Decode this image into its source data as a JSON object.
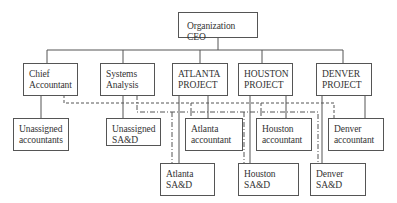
{
  "diagram": {
    "type": "organization-chart",
    "nodes": [
      {
        "id": "ceo",
        "label": "Organization CEO"
      },
      {
        "id": "chief_accountant",
        "label": "Chief\nAccountant"
      },
      {
        "id": "systems_analysis",
        "label": "Systems\nAnalysis"
      },
      {
        "id": "atlanta_project",
        "label": "ATLANTA\nPROJECT"
      },
      {
        "id": "houston_project",
        "label": "HOUSTON\nPROJECT"
      },
      {
        "id": "denver_project",
        "label": "DENVER\nPROJECT"
      },
      {
        "id": "unassigned_accountants",
        "label": "Unassigned\naccountants"
      },
      {
        "id": "unassigned_sad",
        "label": "Unassigned\nSA&D"
      },
      {
        "id": "atlanta_accountant",
        "label": "Atlanta\naccountant"
      },
      {
        "id": "houston_accountant",
        "label": "Houston\naccountant"
      },
      {
        "id": "denver_accountant",
        "label": "Denver\naccountant"
      },
      {
        "id": "atlanta_sad",
        "label": "Atlanta\nSA&D"
      },
      {
        "id": "houston_sad",
        "label": "Houston\nSA&D"
      },
      {
        "id": "denver_sad",
        "label": "Denver\nSA&D"
      }
    ],
    "edges": [
      {
        "from": "ceo",
        "to": "chief_accountant",
        "style": "solid"
      },
      {
        "from": "ceo",
        "to": "systems_analysis",
        "style": "solid"
      },
      {
        "from": "ceo",
        "to": "atlanta_project",
        "style": "solid"
      },
      {
        "from": "ceo",
        "to": "houston_project",
        "style": "solid"
      },
      {
        "from": "ceo",
        "to": "denver_project",
        "style": "solid"
      },
      {
        "from": "chief_accountant",
        "to": "unassigned_accountants",
        "style": "solid"
      },
      {
        "from": "systems_analysis",
        "to": "unassigned_sad",
        "style": "solid"
      },
      {
        "from": "atlanta_project",
        "to": "atlanta_accountant",
        "style": "solid"
      },
      {
        "from": "atlanta_project",
        "to": "atlanta_sad",
        "style": "solid"
      },
      {
        "from": "houston_project",
        "to": "houston_accountant",
        "style": "solid"
      },
      {
        "from": "houston_project",
        "to": "houston_sad",
        "style": "solid"
      },
      {
        "from": "denver_project",
        "to": "denver_accountant",
        "style": "solid"
      },
      {
        "from": "denver_project",
        "to": "denver_sad",
        "style": "solid"
      },
      {
        "from": "chief_accountant",
        "to": "atlanta_accountant",
        "style": "dashed"
      },
      {
        "from": "chief_accountant",
        "to": "houston_accountant",
        "style": "dashed"
      },
      {
        "from": "chief_accountant",
        "to": "denver_accountant",
        "style": "dashed"
      },
      {
        "from": "systems_analysis",
        "to": "atlanta_sad",
        "style": "dash-dot"
      },
      {
        "from": "systems_analysis",
        "to": "houston_sad",
        "style": "dash-dot"
      },
      {
        "from": "systems_analysis",
        "to": "denver_sad",
        "style": "dash-dot"
      }
    ]
  },
  "colors": {
    "line": "#555555",
    "box_border": "#555555",
    "text": "#333333"
  }
}
